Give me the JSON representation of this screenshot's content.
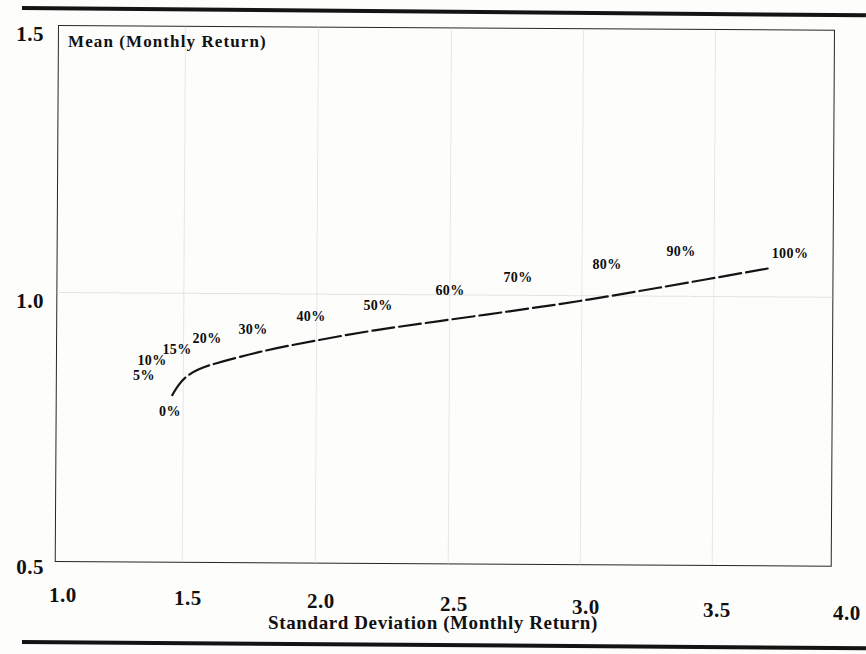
{
  "figure": {
    "background_color": "#fdfdfc",
    "ink_color": "#111111",
    "rule_color": "#141414"
  },
  "chart_data": {
    "type": "line",
    "title": "",
    "xlabel": "Standard Deviation (Monthly Return)",
    "ylabel": "Mean (Monthly Return)",
    "xlim": [
      1.0,
      4.0
    ],
    "ylim": [
      0.5,
      1.5
    ],
    "xticks": [
      "1.0",
      "1.5",
      "2.0",
      "2.5",
      "3.0",
      "3.5",
      "4.0"
    ],
    "yticks": [
      "0.5",
      "1.0",
      "1.5"
    ],
    "grid": "faint dotted gridlines at major ticks",
    "legend": "none",
    "series": [
      {
        "name": "Efficient frontier",
        "x": [
          1.45,
          1.47,
          1.5,
          1.55,
          1.62,
          1.8,
          2.0,
          2.23,
          2.48,
          2.75,
          3.02,
          3.33,
          3.75
        ],
        "y": [
          0.812,
          0.828,
          0.845,
          0.86,
          0.872,
          0.895,
          0.915,
          0.935,
          0.953,
          0.972,
          0.992,
          1.018,
          1.055
        ],
        "point_labels": [
          "0%",
          "5%",
          "10%",
          "15%",
          "20%",
          "30%",
          "40%",
          "50%",
          "60%",
          "70%",
          "80%",
          "90%",
          "100%"
        ]
      }
    ],
    "annotations": [
      {
        "text": "0%",
        "x_px": 170,
        "y_px": 412
      },
      {
        "text": "5%",
        "x_px": 144,
        "y_px": 376
      },
      {
        "text": "10%",
        "x_px": 152,
        "y_px": 361
      },
      {
        "text": "15%",
        "x_px": 177,
        "y_px": 350
      },
      {
        "text": "20%",
        "x_px": 207,
        "y_px": 339
      },
      {
        "text": "30%",
        "x_px": 253,
        "y_px": 330
      },
      {
        "text": "40%",
        "x_px": 311,
        "y_px": 317
      },
      {
        "text": "50%",
        "x_px": 378,
        "y_px": 306
      },
      {
        "text": "60%",
        "x_px": 450,
        "y_px": 291
      },
      {
        "text": "70%",
        "x_px": 518,
        "y_px": 278
      },
      {
        "text": "80%",
        "x_px": 607,
        "y_px": 265
      },
      {
        "text": "90%",
        "x_px": 681,
        "y_px": 252
      },
      {
        "text": "100%",
        "x_px": 790,
        "y_px": 254
      }
    ]
  },
  "axes": {
    "y_labels": [
      {
        "value": "1.5",
        "x_px": 44,
        "y_px": 22
      },
      {
        "value": "1.0",
        "x_px": 44,
        "y_px": 289
      },
      {
        "value": "0.5",
        "x_px": 44,
        "y_px": 555
      }
    ],
    "x_labels": [
      {
        "value": "1.0",
        "x_px": 49,
        "y_px": 583
      },
      {
        "value": "1.5",
        "x_px": 174,
        "y_px": 586
      },
      {
        "value": "2.0",
        "x_px": 307,
        "y_px": 589
      },
      {
        "value": "2.5",
        "x_px": 440,
        "y_px": 592
      },
      {
        "value": "3.0",
        "x_px": 572,
        "y_px": 595
      },
      {
        "value": "3.5",
        "x_px": 703,
        "y_px": 598
      },
      {
        "value": "4.0",
        "x_px": 833,
        "y_px": 601
      }
    ],
    "vertical_gridlines_px": [
      126,
      259,
      392,
      524,
      656
    ],
    "horizontal_gridlines_px": [
      266
    ]
  }
}
